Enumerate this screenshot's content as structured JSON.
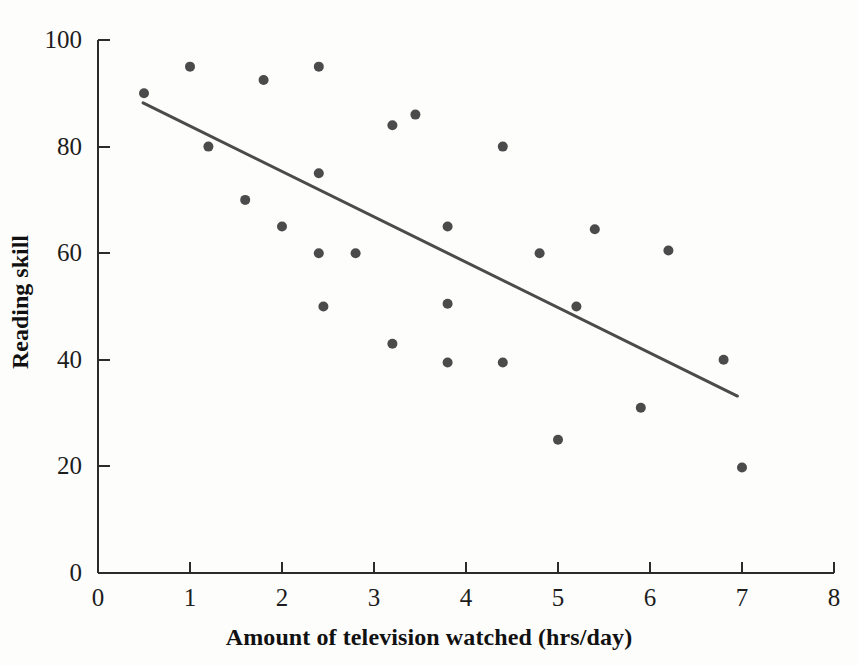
{
  "chart_data": {
    "type": "scatter",
    "title": "",
    "xlabel": "Amount of television watched (hrs/day)",
    "ylabel": "Reading skill",
    "xlim": [
      0,
      8
    ],
    "ylim": [
      0,
      100
    ],
    "xticks": [
      0,
      1,
      2,
      3,
      4,
      5,
      6,
      7,
      8
    ],
    "xtick_labels": [
      "0",
      "1",
      "2",
      "3",
      "4",
      "5",
      "6",
      "7",
      "8"
    ],
    "yticks": [
      0,
      20,
      40,
      60,
      80,
      100
    ],
    "ytick_labels": [
      "0",
      "20",
      "40",
      "60",
      "80",
      "100"
    ],
    "grid": false,
    "legend": "none",
    "marker": "filled-circle",
    "marker_color": "#4b4b4b",
    "marker_size_px": 10,
    "axis_color": "#2b2b2b",
    "points": [
      {
        "x": 0.5,
        "y": 90
      },
      {
        "x": 1.0,
        "y": 95
      },
      {
        "x": 1.2,
        "y": 80
      },
      {
        "x": 1.6,
        "y": 70
      },
      {
        "x": 1.8,
        "y": 92.5
      },
      {
        "x": 2.0,
        "y": 65
      },
      {
        "x": 2.4,
        "y": 95
      },
      {
        "x": 2.4,
        "y": 75
      },
      {
        "x": 2.4,
        "y": 60
      },
      {
        "x": 2.45,
        "y": 50
      },
      {
        "x": 2.8,
        "y": 60
      },
      {
        "x": 3.2,
        "y": 84
      },
      {
        "x": 3.2,
        "y": 43
      },
      {
        "x": 3.45,
        "y": 86
      },
      {
        "x": 3.8,
        "y": 65
      },
      {
        "x": 3.8,
        "y": 50.5
      },
      {
        "x": 3.8,
        "y": 39.5
      },
      {
        "x": 4.4,
        "y": 80
      },
      {
        "x": 4.4,
        "y": 39.5
      },
      {
        "x": 4.8,
        "y": 60
      },
      {
        "x": 5.0,
        "y": 25
      },
      {
        "x": 5.2,
        "y": 50
      },
      {
        "x": 5.4,
        "y": 64.5
      },
      {
        "x": 5.9,
        "y": 31
      },
      {
        "x": 6.2,
        "y": 60.5
      },
      {
        "x": 6.8,
        "y": 40
      },
      {
        "x": 7.0,
        "y": 19.8
      }
    ],
    "trendline": {
      "name": "least-squares regression line",
      "color": "#4b4b4b",
      "width_px": 3,
      "x_start": 0.49,
      "y_start": 88.2,
      "x_end": 6.95,
      "y_end": 33.2
    }
  }
}
